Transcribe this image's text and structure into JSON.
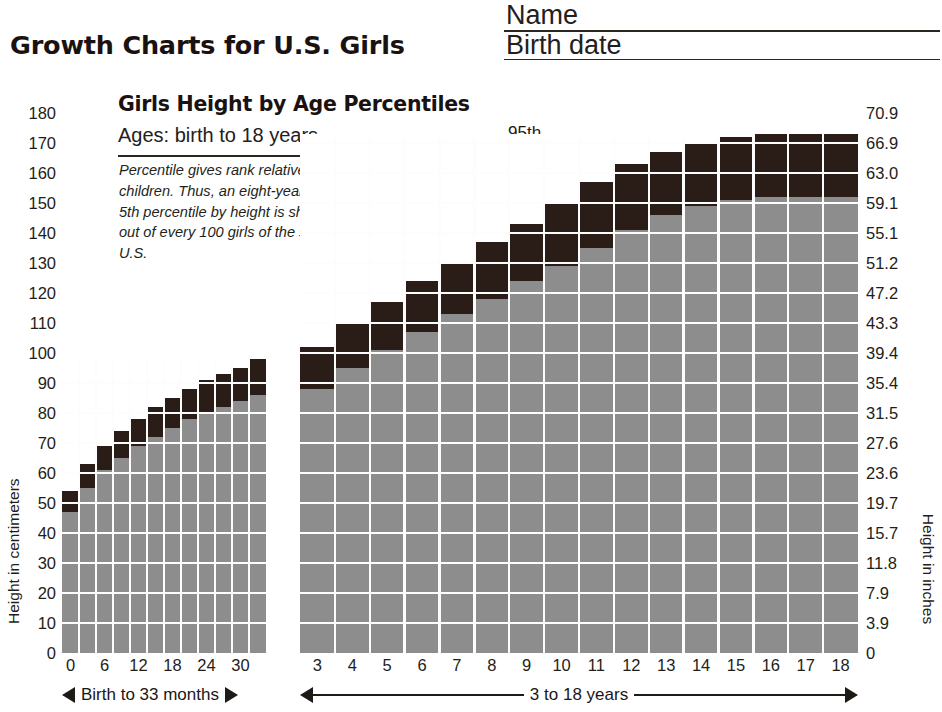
{
  "header": {
    "title": "Growth Charts for U.S. Girls",
    "name_label": "Name",
    "birthdate_label": "Birth date"
  },
  "chart_header": {
    "title": "Girls Height by Age Percentiles",
    "subtitle": "Ages: birth to 18 years",
    "note": "Percentile gives rank relative to 100 children. Thus, an eight-year-old girl at the 5th percentile by height is shorter than 95 out of every 100 girls of the same age in the U.S."
  },
  "callouts": {
    "p95": "95th",
    "p50": "50th",
    "p5": "5th"
  },
  "axes": {
    "y_left_title": "Height in centimeters",
    "y_right_title": "Height in inches",
    "y_left_ticks": [
      "180",
      "170",
      "160",
      "150",
      "140",
      "130",
      "120",
      "110",
      "100",
      "90",
      "80",
      "70",
      "60",
      "50",
      "40",
      "30",
      "20",
      "10",
      "0"
    ],
    "y_right_ticks": [
      "70.9",
      "66.9",
      "63.0",
      "59.1",
      "55.1",
      "51.2",
      "47.2",
      "43.3",
      "39.4",
      "35.4",
      "31.5",
      "27.6",
      "23.6",
      "19.7",
      "15.7",
      "11.8",
      "7.9",
      "3.9",
      "0"
    ],
    "x_left_ticks": [
      "0",
      "6",
      "12",
      "18",
      "24",
      "30"
    ],
    "x_right_ticks": [
      "3",
      "4",
      "5",
      "6",
      "7",
      "8",
      "9",
      "10",
      "11",
      "12",
      "13",
      "14",
      "15",
      "16",
      "17",
      "18"
    ],
    "range_left_label": "Birth to 33 months",
    "range_right_label": "3 to 18 years"
  },
  "colors": {
    "bar_light": "#8d8d8d",
    "bar_dark": "#2a1d17",
    "grid": "#fdfdfd",
    "text": "#1a1512"
  },
  "chart_data": {
    "type": "bar",
    "title": "Girls Height by Age Percentiles",
    "subtitle": "Ages: birth to 18 years",
    "xlabel": "Age",
    "ylabel": "Height in centimeters",
    "ylim": [
      0,
      180
    ],
    "ytick_step": 10,
    "grid": true,
    "legend": [
      "5th",
      "50th",
      "95th"
    ],
    "legend_position": "inside-upper-left",
    "secondary_axis": {
      "label": "Height in inches",
      "ticks": [
        0,
        3.9,
        7.9,
        11.8,
        15.7,
        19.7,
        23.6,
        27.6,
        31.5,
        35.4,
        39.4,
        43.3,
        47.2,
        51.2,
        55.1,
        59.1,
        63.0,
        66.9,
        70.9
      ]
    },
    "panels": [
      {
        "name": "Birth to 33 months",
        "x_unit": "months",
        "xlabel": "Birth to 33 months",
        "categories": [
          0,
          3,
          6,
          9,
          12,
          15,
          18,
          21,
          24,
          27,
          30,
          33
        ],
        "tick_labels": [
          "0",
          "6",
          "12",
          "18",
          "24",
          "30"
        ],
        "series": [
          {
            "name": "5th",
            "values": [
              47,
              55,
              61,
              65,
              69,
              72,
              75,
              78,
              80,
              82,
              84,
              86
            ]
          },
          {
            "name": "50th",
            "values": [
              50,
              59,
              65,
              70,
              74,
              77,
              80,
              83,
              86,
              88,
              90,
              92
            ]
          },
          {
            "name": "95th",
            "values": [
              54,
              63,
              69,
              74,
              78,
              82,
              85,
              88,
              91,
              93,
              95,
              98
            ]
          }
        ]
      },
      {
        "name": "3 to 18 years",
        "x_unit": "years",
        "xlabel": "3 to 18 years",
        "categories": [
          3,
          4,
          5,
          6,
          7,
          8,
          9,
          10,
          11,
          12,
          13,
          14,
          15,
          16,
          17,
          18
        ],
        "tick_labels": [
          "3",
          "4",
          "5",
          "6",
          "7",
          "8",
          "9",
          "10",
          "11",
          "12",
          "13",
          "14",
          "15",
          "16",
          "17",
          "18"
        ],
        "series": [
          {
            "name": "5th",
            "values": [
              88,
              95,
              101,
              107,
              113,
              118,
              124,
              129,
              135,
              141,
              146,
              149,
              151,
              152,
              152,
              152
            ]
          },
          {
            "name": "50th",
            "values": [
              95,
              102,
              109,
              115,
              122,
              128,
              133,
              139,
              145,
              152,
              157,
              160,
              162,
              163,
              163,
              163
            ]
          },
          {
            "name": "95th",
            "values": [
              102,
              110,
              117,
              124,
              130,
              137,
              143,
              150,
              157,
              163,
              167,
              170,
              172,
              173,
              173,
              173
            ]
          }
        ]
      }
    ]
  }
}
